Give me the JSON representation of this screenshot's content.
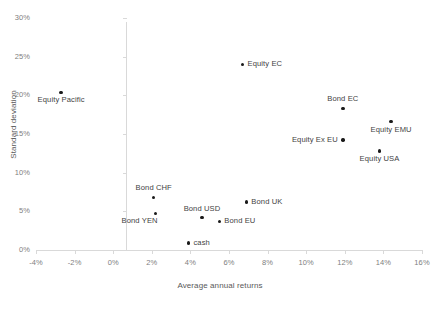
{
  "chart_data": {
    "type": "scatter",
    "title": "",
    "xlabel": "Average annual returns",
    "ylabel": "Standard deviation",
    "xlim": [
      -4,
      16
    ],
    "ylim": [
      0,
      30
    ],
    "xticks": [
      "-4%",
      "-2%",
      "0%",
      "2%",
      "4%",
      "6%",
      "8%",
      "10%",
      "12%",
      "14%",
      "16%"
    ],
    "xtick_values": [
      -4,
      -2,
      0,
      2,
      4,
      6,
      8,
      10,
      12,
      14,
      16
    ],
    "yticks": [
      "0%",
      "5%",
      "10%",
      "15%",
      "20%",
      "25%",
      "30%"
    ],
    "ytick_values": [
      0,
      5,
      10,
      15,
      20,
      25,
      30
    ],
    "grid": false,
    "legend": "none",
    "marker_color": "#1a1a1a",
    "axis_color": "#d9d9d9",
    "tick_text_color": "#808080",
    "label_text_color": "#3f3f3f",
    "points": [
      {
        "label": "Equity Pacific",
        "x": -2.7,
        "y": 20.4,
        "label_pos": "below"
      },
      {
        "label": "Equity EC",
        "x": 6.7,
        "y": 24.0,
        "label_pos": "right"
      },
      {
        "label": "Bond EC",
        "x": 11.9,
        "y": 18.3,
        "label_pos": "above"
      },
      {
        "label": "Equity EMU",
        "x": 14.4,
        "y": 16.6,
        "label_pos": "below"
      },
      {
        "label": "Equity Ex EU",
        "x": 11.9,
        "y": 14.2,
        "label_pos": "left"
      },
      {
        "label": "Equity USA",
        "x": 13.8,
        "y": 12.8,
        "label_pos": "below"
      },
      {
        "label": "Bond CHF",
        "x": 2.1,
        "y": 6.8,
        "label_pos": "above"
      },
      {
        "label": "Bond UK",
        "x": 6.9,
        "y": 6.2,
        "label_pos": "right"
      },
      {
        "label": "Bond YEN",
        "x": 2.2,
        "y": 4.7,
        "label_pos": "below-left"
      },
      {
        "label": "Bond USD",
        "x": 4.6,
        "y": 4.2,
        "label_pos": "above"
      },
      {
        "label": "Bond EU",
        "x": 5.5,
        "y": 3.7,
        "label_pos": "right"
      },
      {
        "label": "cash",
        "x": 3.9,
        "y": 0.9,
        "label_pos": "right"
      }
    ]
  }
}
